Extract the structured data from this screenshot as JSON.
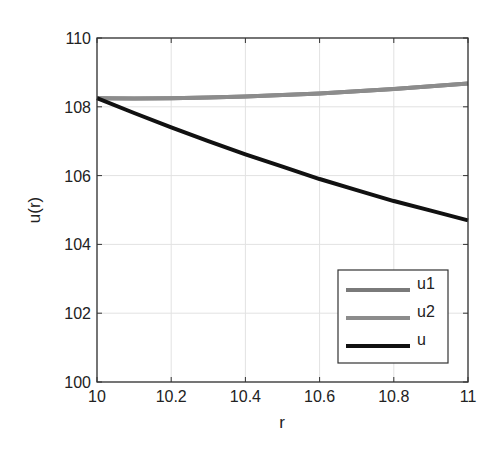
{
  "chart_data": {
    "type": "line",
    "title": "",
    "xlabel": "r",
    "ylabel": "u(r)",
    "xlim": [
      10,
      11
    ],
    "ylim": [
      100,
      110
    ],
    "grid": true,
    "legend_position": "lower right",
    "x_ticks": [
      "10",
      "10.2",
      "10.4",
      "10.6",
      "10.8",
      "11"
    ],
    "y_ticks": [
      "100",
      "102",
      "104",
      "106",
      "108",
      "110"
    ],
    "x": [
      10,
      10.1,
      10.2,
      10.3,
      10.4,
      10.5,
      10.6,
      10.7,
      10.8,
      10.9,
      11
    ],
    "series": [
      {
        "name": "u1",
        "color": "#7a7a7a",
        "values": [
          108.25,
          108.24,
          108.25,
          108.27,
          108.3,
          108.34,
          108.39,
          108.45,
          108.52,
          108.6,
          108.68
        ]
      },
      {
        "name": "u2",
        "color": "#8c8c8c",
        "values": [
          108.25,
          108.24,
          108.25,
          108.27,
          108.3,
          108.34,
          108.39,
          108.45,
          108.52,
          108.6,
          108.68
        ]
      },
      {
        "name": "u",
        "color": "#111111",
        "values": [
          108.25,
          107.82,
          107.4,
          107.0,
          106.62,
          106.26,
          105.9,
          105.58,
          105.26,
          104.98,
          104.7
        ]
      }
    ]
  },
  "legend": {
    "items": [
      "u1",
      "u2",
      "u"
    ]
  }
}
